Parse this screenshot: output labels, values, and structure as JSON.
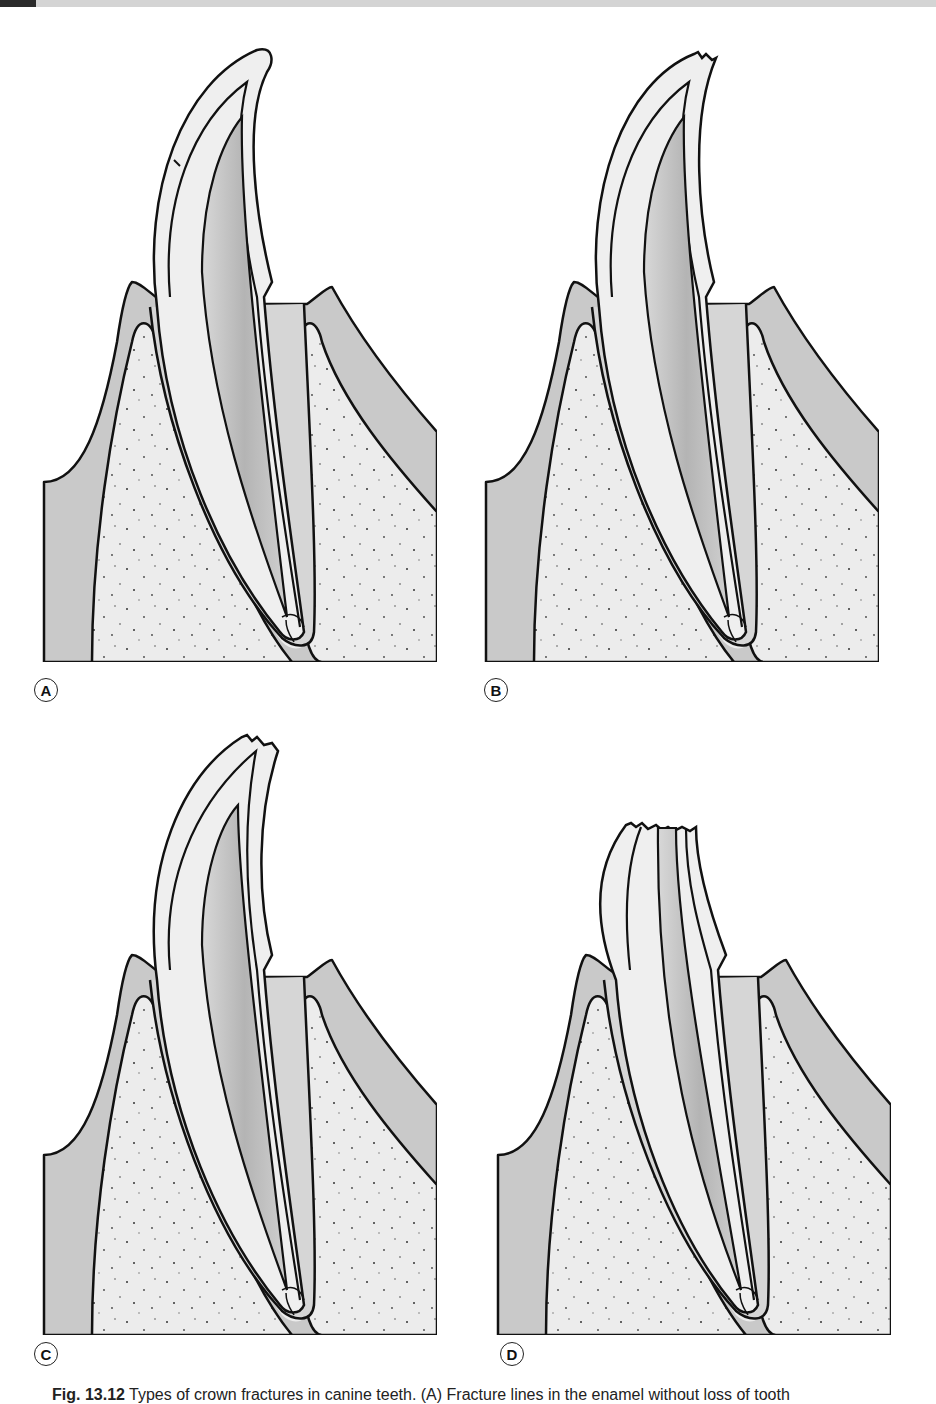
{
  "figure": {
    "caption_prefix": "Fig. 13.12",
    "caption_text": " Types of crown fractures in canine teeth. (A) Fracture lines in the enamel without loss of tooth",
    "panels": [
      {
        "id": "A",
        "label": "A",
        "description": "Intact canine with enamel fracture line (crack) near crown"
      },
      {
        "id": "B",
        "label": "B",
        "description": "Enamel fracture at crown tip"
      },
      {
        "id": "C",
        "label": "C",
        "description": "Uncomplicated crown fracture involving enamel and dentin"
      },
      {
        "id": "D",
        "label": "D",
        "description": "Complicated crown fracture with pulp exposure"
      }
    ]
  },
  "colors": {
    "outline": "#111111",
    "gingiva": "#c9c9c9",
    "bone": "#ececec",
    "enamel_dentin": "#efefef",
    "pulp": "#bdbdbd",
    "background": "#ffffff",
    "header_bar": "#d4d4d4",
    "header_accent": "#2a2a2a"
  }
}
